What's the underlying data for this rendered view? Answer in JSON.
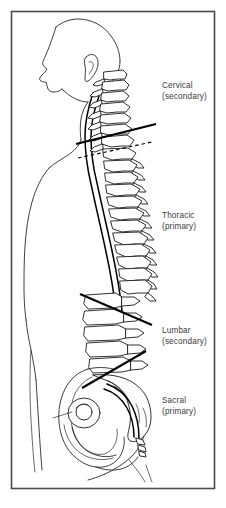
{
  "figure": {
    "frame": {
      "x": 11,
      "y": 11,
      "width": 204,
      "height": 478,
      "border_color": "#4a4a4a",
      "background_color": "#ffffff"
    },
    "line_color": "#1a1a1a",
    "text_color": "#3a3a3a"
  },
  "labels": [
    {
      "id": "cervical",
      "name": "Cervical",
      "qualifier": "(secondary)",
      "x": 162,
      "y": 88,
      "curve_type": "secondary"
    },
    {
      "id": "thoracic",
      "name": "Thoracic",
      "qualifier": "(primary)",
      "x": 162,
      "y": 218,
      "curve_type": "primary"
    },
    {
      "id": "lumbar",
      "name": "Lumbar",
      "qualifier": "(secondary)",
      "x": 162,
      "y": 333,
      "curve_type": "secondary"
    },
    {
      "id": "sacral",
      "name": "Sacral",
      "qualifier": "(primary)",
      "x": 162,
      "y": 403,
      "curve_type": "primary"
    }
  ],
  "regions": [
    {
      "id": "cervical-region",
      "label": "cervical vertebrae",
      "vertebra_count": 7
    },
    {
      "id": "thoracic-region",
      "label": "thoracic vertebrae",
      "vertebra_count": 12
    },
    {
      "id": "lumbar-region",
      "label": "lumbar vertebrae",
      "vertebra_count": 5
    },
    {
      "id": "sacral-region",
      "label": "sacrum and coccyx",
      "vertebra_count": 5
    }
  ],
  "dividers": [
    {
      "id": "cervico-thoracic-divider",
      "x1": 76,
      "y1": 144,
      "x2": 156,
      "y2": 124,
      "style": "solid"
    },
    {
      "id": "cervico-thoracic-dash",
      "x1": 78,
      "y1": 158,
      "x2": 152,
      "y2": 142,
      "style": "dashed"
    },
    {
      "id": "thoraco-lumbar-divider",
      "x1": 80,
      "y1": 294,
      "x2": 152,
      "y2": 325,
      "style": "solid"
    },
    {
      "id": "lumbo-sacral-divider",
      "x1": 82,
      "y1": 388,
      "x2": 146,
      "y2": 351,
      "style": "solid"
    }
  ],
  "anatomy": {
    "head": "lateral profile of face, skull and ear",
    "torso": "chest and abdominal wall outline",
    "pelvis": "innominate bone with acetabulum",
    "spinal_canal": "vertebral canal drawn as paired curved lines anterior to spinous processes"
  }
}
